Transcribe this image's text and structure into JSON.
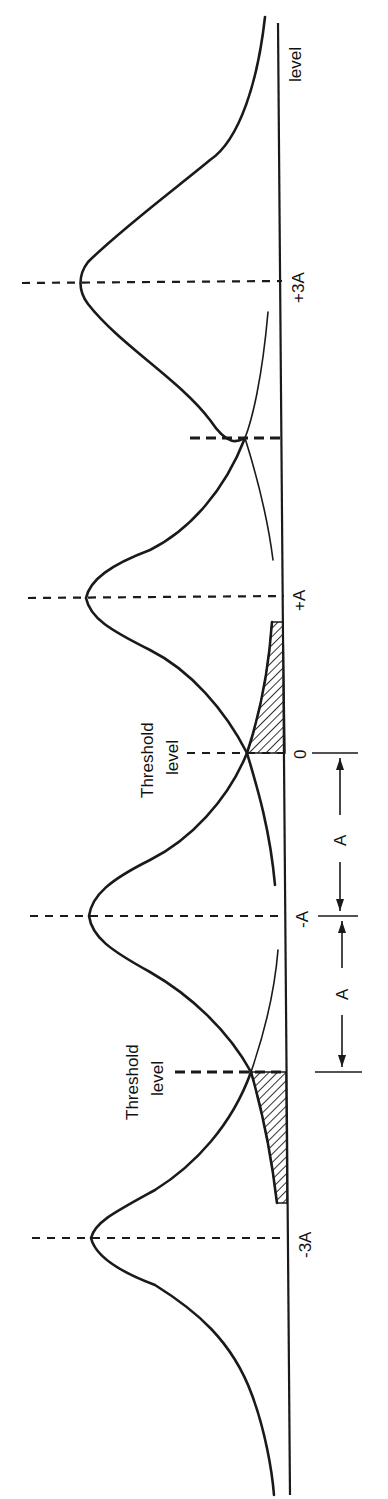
{
  "figure": {
    "orientation": "rotated 90° counter-clockwise (baseline vertical on the right, text reads bottom-to-top)",
    "baseline_label": "level",
    "level_labels": [
      {
        "id": "plus3A",
        "text": "+3A"
      },
      {
        "id": "plusA",
        "text": "+A"
      },
      {
        "id": "zero",
        "text": "0"
      },
      {
        "id": "minusA",
        "text": "-A"
      },
      {
        "id": "minus3A",
        "text": "-3A"
      }
    ],
    "threshold_labels": [
      {
        "id": "threshold_upper",
        "line1": "Threshold",
        "line2": "level"
      },
      {
        "id": "threshold_lower",
        "line1": "Threshold",
        "line2": "level"
      }
    ],
    "dimension_labels": [
      {
        "id": "spacing_upper",
        "text": "A"
      },
      {
        "id": "spacing_lower",
        "text": "A"
      }
    ],
    "curves": [
      {
        "mean": "-3A",
        "shaded_tail": true
      },
      {
        "mean": "-A",
        "shaded_tail": false
      },
      {
        "mean": "+A",
        "shaded_tail": true
      },
      {
        "mean": "+3A",
        "shaded_tail": false
      }
    ],
    "colors": {
      "ink": "#1a1a1a",
      "background": "#ffffff"
    }
  }
}
